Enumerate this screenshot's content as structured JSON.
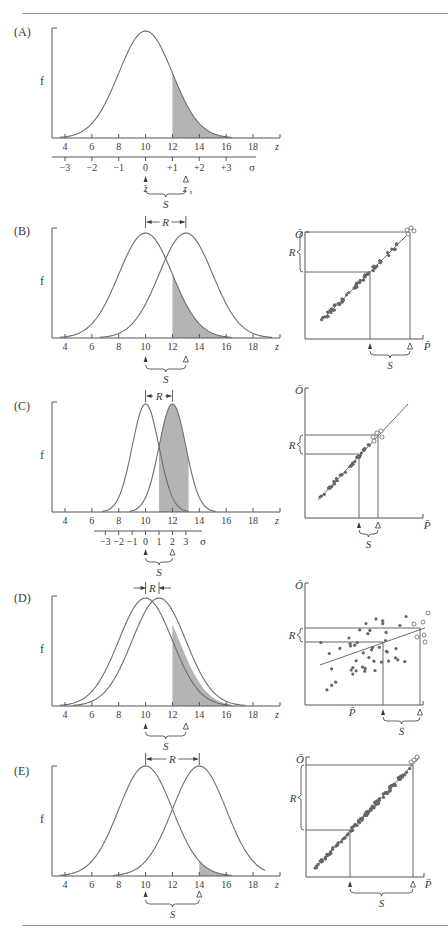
{
  "figure": {
    "colors": {
      "curve": "#6e6e6e",
      "axis": "#555555",
      "shade": "#b4b4b4",
      "dot": "#666666",
      "text": "#3a3a3a"
    },
    "axis_labels": {
      "f": "f",
      "z": "z",
      "sigma": "σ",
      "O": "Ō",
      "P": "P̄",
      "R": "R",
      "S": "S",
      "zbar": "z̄",
      "zs": "z",
      "zs_sub": "s"
    },
    "z_ticks": [
      "4",
      "6",
      "8",
      "10",
      "12",
      "14",
      "16",
      "18"
    ],
    "panels": [
      {
        "label": "(A)",
        "sigma_ticks": [
          "−3",
          "−2",
          "−1",
          "0",
          "+1",
          "+2",
          "+3"
        ]
      },
      {
        "label": "(B)"
      },
      {
        "label": "(C)",
        "sigma_ticks": [
          "−3",
          "−2",
          "−1",
          "0",
          "1",
          "2",
          "3"
        ]
      },
      {
        "label": "(D)"
      },
      {
        "label": "(E)"
      }
    ]
  },
  "chart_data": [
    {
      "panel": "A",
      "type": "area",
      "title": "(A)",
      "xlabel": "z",
      "ylabel": "f",
      "x_ticks": [
        4,
        6,
        8,
        10,
        12,
        14,
        16,
        18
      ],
      "secondary_axis": {
        "label": "σ",
        "ticks": [
          "−3",
          "−2",
          "−1",
          "0",
          "+1",
          "+2",
          "+3"
        ],
        "maps_to_z": [
          4,
          6,
          8,
          10,
          12,
          14,
          16
        ]
      },
      "series": [
        {
          "name": "parent distribution",
          "mean": 10,
          "sd": 2
        }
      ],
      "shaded_region": {
        "from": 12,
        "to": 16
      },
      "markers": {
        "z_bar": 10,
        "z_s": 13
      },
      "annotations": [
        "S (z̄ → z_s)"
      ]
    },
    {
      "panel": "B",
      "type": "area",
      "title": "(B)",
      "xlabel": "z",
      "ylabel": "f",
      "x_ticks": [
        4,
        6,
        8,
        10,
        12,
        14,
        16,
        18
      ],
      "series": [
        {
          "name": "parents",
          "mean": 10,
          "sd": 2
        },
        {
          "name": "offspring",
          "mean": 13,
          "sd": 2
        }
      ],
      "shaded_region": {
        "from": 12,
        "to": 16
      },
      "R": [
        10,
        13
      ],
      "S": [
        10,
        13
      ]
    },
    {
      "panel": "B-regression",
      "type": "scatter",
      "xlabel": "P̄",
      "ylabel": "Ō",
      "annotations": [
        "R",
        "S"
      ],
      "regression": "slope ≈ 1 (high heritability)"
    },
    {
      "panel": "C",
      "type": "area",
      "title": "(C)",
      "xlabel": "z",
      "ylabel": "f",
      "x_ticks": [
        4,
        6,
        8,
        10,
        12,
        14,
        16,
        18
      ],
      "secondary_axis": {
        "label": "σ",
        "ticks": [
          "−3",
          "−2",
          "−1",
          "0",
          "1",
          "2",
          "3"
        ],
        "maps_to_z": [
          7,
          8,
          9,
          10,
          11,
          12,
          13
        ]
      },
      "series": [
        {
          "name": "parents",
          "mean": 10,
          "sd": 1
        },
        {
          "name": "offspring",
          "mean": 12,
          "sd": 1
        }
      ],
      "shaded_region": {
        "from": 11,
        "to": 13
      },
      "R": [
        10,
        12
      ],
      "S": [
        10,
        12
      ]
    },
    {
      "panel": "C-regression",
      "type": "scatter",
      "xlabel": "P̄",
      "ylabel": "Ō",
      "annotations": [
        "R",
        "S"
      ],
      "regression": "slope ≈ 1"
    },
    {
      "panel": "D",
      "type": "area",
      "title": "(D)",
      "xlabel": "z",
      "ylabel": "f",
      "x_ticks": [
        4,
        6,
        8,
        10,
        12,
        14,
        16,
        18
      ],
      "series": [
        {
          "name": "parents",
          "mean": 10,
          "sd": 2
        },
        {
          "name": "offspring",
          "mean": 11,
          "sd": 2
        }
      ],
      "shaded_region": {
        "from": 12,
        "to": 16
      },
      "R": [
        10,
        11
      ],
      "S": [
        10,
        13
      ]
    },
    {
      "panel": "D-regression",
      "type": "scatter",
      "xlabel": "P̄",
      "ylabel": "Ō",
      "annotations": [
        "R",
        "S"
      ],
      "regression": "shallow slope (low heritability)"
    },
    {
      "panel": "E",
      "type": "area",
      "title": "(E)",
      "xlabel": "z",
      "ylabel": "f",
      "x_ticks": [
        4,
        6,
        8,
        10,
        12,
        14,
        16,
        18
      ],
      "series": [
        {
          "name": "parents",
          "mean": 10,
          "sd": 2
        },
        {
          "name": "offspring",
          "mean": 14,
          "sd": 2
        }
      ],
      "shaded_region": {
        "from": 14,
        "to": 16
      },
      "R": [
        10,
        14
      ],
      "S": [
        10,
        14
      ]
    },
    {
      "panel": "E-regression",
      "type": "scatter",
      "xlabel": "P̄",
      "ylabel": "Ō",
      "annotations": [
        "R",
        "S"
      ],
      "regression": "slope ≈ 1"
    }
  ]
}
